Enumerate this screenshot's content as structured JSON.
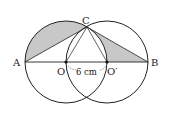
{
  "diagram": {
    "type": "geometry",
    "points": {
      "A": {
        "label": "A"
      },
      "B": {
        "label": "B"
      },
      "C": {
        "label": "C"
      },
      "O": {
        "label": "O"
      },
      "O_prime": {
        "label": "O′"
      }
    },
    "measurement": {
      "label": "6 cm",
      "between": [
        "O",
        "O′"
      ]
    },
    "colors": {
      "stroke": "#222222",
      "shade": "#c8c8c8",
      "background": "#ffffff"
    }
  }
}
